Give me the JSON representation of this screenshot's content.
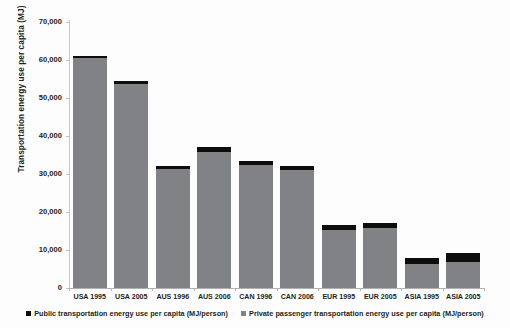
{
  "chart_data": {
    "type": "bar",
    "stacked": true,
    "title": "",
    "xlabel": "",
    "ylabel": "Transportation energy use per capita (MJ)",
    "ylim": [
      0,
      70000
    ],
    "ytick_labels": [
      "70,000",
      "60,000",
      "50,000",
      "40,000",
      "30,000",
      "20,000",
      "10,000",
      "0"
    ],
    "ytick_values": [
      70000,
      60000,
      50000,
      40000,
      30000,
      20000,
      10000,
      0
    ],
    "grid": false,
    "legend_position": "bottom",
    "categories": [
      "USA 1995",
      "USA 2005",
      "AUS 1996",
      "AUS 2006",
      "CAN 1996",
      "CAN 2006",
      "EUR 1995",
      "EUR 2005",
      "ASIA 1995",
      "ASIA 2005"
    ],
    "series": [
      {
        "name": "Private passenger transportation energy use per capita (MJ/person)",
        "color": "#808285",
        "values": [
          60500,
          53800,
          31200,
          35900,
          32400,
          31000,
          15200,
          15800,
          6200,
          6900
        ]
      },
      {
        "name": "Public transportation energy use per capita (MJ/person)",
        "color": "#0d0d0d",
        "values": [
          600,
          700,
          800,
          1100,
          900,
          1100,
          1300,
          1400,
          1800,
          2200
        ]
      }
    ],
    "totals": [
      61100,
      54500,
      32000,
      37000,
      33300,
      32100,
      16500,
      17200,
      8000,
      9100
    ]
  },
  "legend": {
    "items": [
      {
        "swatch": "public-swatch",
        "label": "Public transportation energy use per capita (MJ/person)"
      },
      {
        "swatch": "private-swatch",
        "label": "Private passenger transportation energy use per capita (MJ/person)"
      }
    ]
  },
  "colors": {
    "public": "#0d0d0d",
    "private": "#808285",
    "axis": "#c0c0c0",
    "text": "#231f20",
    "background": "#fdfdfd"
  }
}
